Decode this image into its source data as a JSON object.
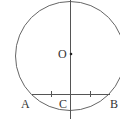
{
  "diagram": {
    "labels": {
      "O": "O",
      "A": "A",
      "B": "B",
      "C": "C"
    },
    "colors": {
      "stroke": "#555555",
      "text": "#333333"
    }
  }
}
